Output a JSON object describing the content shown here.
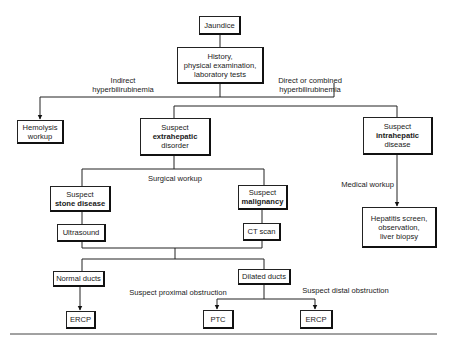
{
  "nodes": {
    "jaundice": {
      "text": "Jaundice"
    },
    "history": {
      "line1": "History,",
      "line2": "physical examination,",
      "line3": "laboratory tests"
    },
    "hemolysis": {
      "line1": "Hemolysis",
      "line2": "workup"
    },
    "extrahepatic": {
      "line1": "Suspect",
      "bold": "extrahepatic",
      "line3": "disorder"
    },
    "intrahepatic": {
      "line1": "Suspect",
      "bold": "intrahepatic",
      "line3": "disease"
    },
    "stone": {
      "line1": "Suspect",
      "bold": "stone disease"
    },
    "malignancy": {
      "line1": "Suspect",
      "bold": "malignancy"
    },
    "ultrasound": {
      "text": "Ultrasound"
    },
    "ct": {
      "text": "CT scan"
    },
    "hepatitis": {
      "line1": "Hepatitis screen,",
      "line2": "observation,",
      "line3": "liver biopsy"
    },
    "normal_ducts": {
      "text": "Normal ducts"
    },
    "dilated_ducts": {
      "text": "Dilated ducts"
    },
    "ercp_left": {
      "text": "ERCP"
    },
    "ptc": {
      "text": "PTC"
    },
    "ercp_right": {
      "text": "ERCP"
    }
  },
  "edge_labels": {
    "indirect_1": "Indirect",
    "indirect_2": "hyperbilirubinemia",
    "direct_1": "Direct or combined",
    "direct_2": "hyperbilirubinemia",
    "surgical": "Surgical workup",
    "medical": "Medical workup",
    "proximal": "Suspect proximal obstruction",
    "distal": "Suspect distal obstruction"
  }
}
